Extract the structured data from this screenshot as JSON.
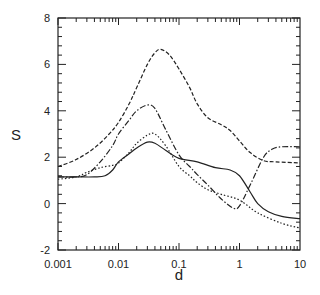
{
  "chart_data": {
    "type": "line",
    "title": "",
    "xlabel": "d",
    "ylabel": "S",
    "xscale": "log",
    "xlim": [
      0.001,
      10
    ],
    "ylim": [
      -2,
      8
    ],
    "grid": false,
    "legend": null,
    "x_ticks": [
      0.001,
      0.01,
      0.1,
      1,
      10
    ],
    "x_tick_labels": [
      "0.001",
      "0.01",
      "0.1",
      "1",
      "10"
    ],
    "y_ticks": [
      -2,
      0,
      2,
      4,
      6,
      8
    ],
    "y_tick_labels": [
      "-2",
      "0",
      "2",
      "4",
      "6",
      "8"
    ],
    "series": [
      {
        "name": "solid",
        "style": "solid",
        "x": [
          0.001,
          0.002,
          0.004,
          0.006,
          0.008,
          0.01,
          0.015,
          0.02,
          0.03,
          0.04,
          0.06,
          0.1,
          0.2,
          0.4,
          0.7,
          1.0,
          1.5,
          2,
          3,
          5,
          10
        ],
        "y": [
          1.15,
          1.15,
          1.15,
          1.2,
          1.45,
          1.8,
          2.15,
          2.4,
          2.65,
          2.6,
          2.3,
          1.95,
          1.8,
          1.55,
          1.45,
          1.2,
          0.5,
          0.0,
          -0.35,
          -0.55,
          -0.65
        ]
      },
      {
        "name": "dashed",
        "style": "dashed",
        "x": [
          0.001,
          0.002,
          0.004,
          0.007,
          0.01,
          0.015,
          0.02,
          0.03,
          0.04,
          0.05,
          0.07,
          0.1,
          0.15,
          0.2,
          0.3,
          0.5,
          0.7,
          1.0,
          1.5,
          2.5,
          4,
          10
        ],
        "y": [
          1.6,
          1.9,
          2.4,
          3.0,
          3.5,
          4.3,
          5.0,
          6.0,
          6.5,
          6.65,
          6.4,
          5.8,
          5.0,
          4.3,
          3.7,
          3.4,
          3.15,
          2.7,
          2.2,
          1.85,
          1.8,
          1.75
        ]
      },
      {
        "name": "dash-dot",
        "style": "dashdot",
        "x": [
          0.001,
          0.002,
          0.003,
          0.005,
          0.008,
          0.01,
          0.015,
          0.02,
          0.03,
          0.04,
          0.06,
          0.1,
          0.15,
          0.2,
          0.3,
          0.5,
          0.8,
          1.0,
          1.5,
          2.5,
          3.5,
          5,
          10
        ],
        "y": [
          1.15,
          1.15,
          1.25,
          1.8,
          2.5,
          3.0,
          3.6,
          4.0,
          4.25,
          4.1,
          3.2,
          2.1,
          1.6,
          1.25,
          0.8,
          0.2,
          -0.2,
          -0.1,
          0.8,
          2.0,
          2.35,
          2.45,
          2.45
        ]
      },
      {
        "name": "dotted",
        "style": "dotted",
        "x": [
          0.001,
          0.002,
          0.003,
          0.005,
          0.008,
          0.01,
          0.015,
          0.02,
          0.03,
          0.04,
          0.06,
          0.1,
          0.15,
          0.2,
          0.3,
          0.5,
          1.0,
          2,
          5,
          10
        ],
        "y": [
          1.05,
          1.15,
          1.35,
          1.55,
          1.65,
          1.75,
          2.2,
          2.6,
          2.95,
          3.0,
          2.5,
          1.6,
          1.2,
          0.9,
          0.6,
          0.4,
          0.15,
          -0.4,
          -0.85,
          -1.05
        ]
      }
    ]
  }
}
